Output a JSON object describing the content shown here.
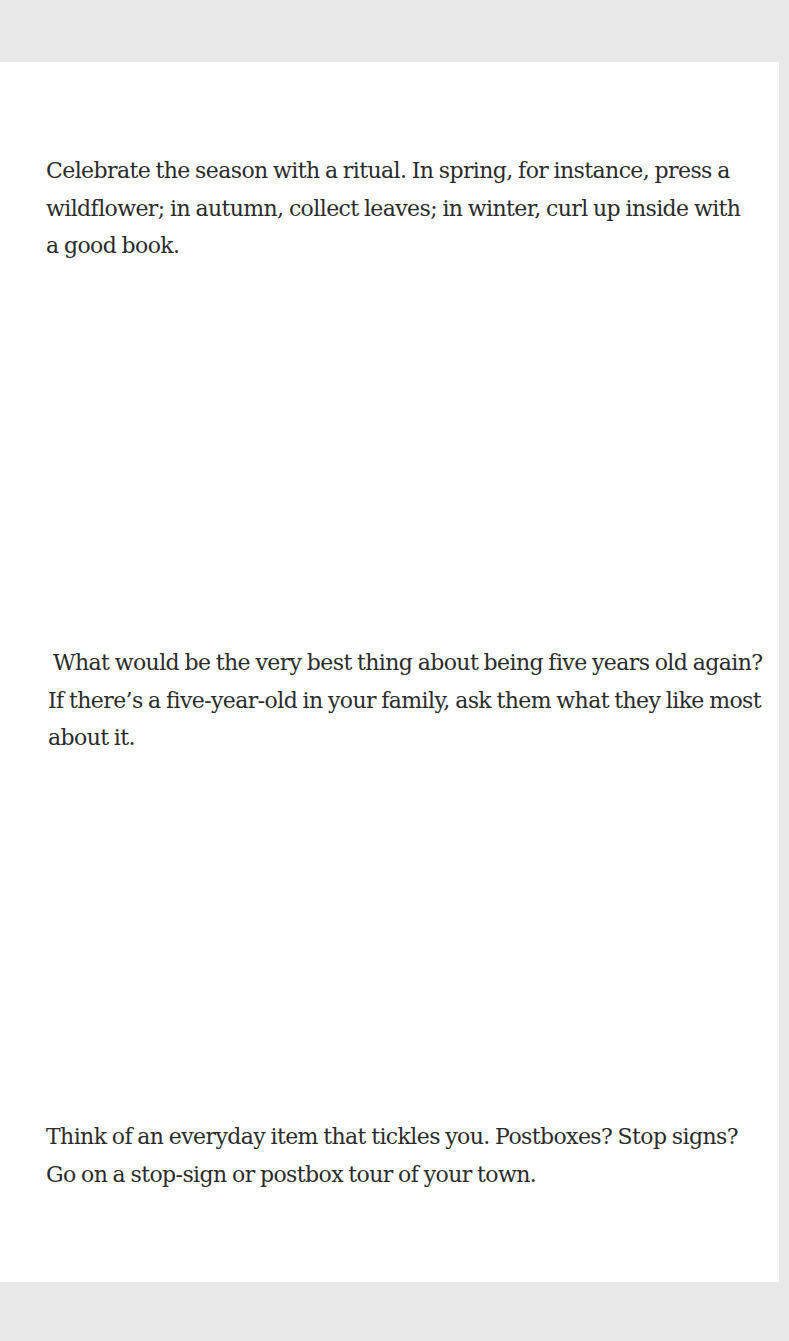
{
  "document": {
    "paragraphs": [
      {
        "text": "Celebrate the season with a ritual. In spring, for instance, press a wildflower; in autumn, collect leaves; in winter, curl up inside with a good book."
      },
      {
        "text": "What would be the very best thing about being five years old again? If there’s a five-year-old in your family, ask them what they like most about it."
      },
      {
        "text": "Think of an everyday item that tickles you. Postboxes? Stop signs? Go on a stop-sign or postbox tour of your town."
      }
    ]
  },
  "colors": {
    "background": "#e8e8e8",
    "page": "#ffffff",
    "text": "#2b2b2b"
  }
}
